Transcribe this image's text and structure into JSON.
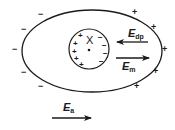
{
  "diagram": {
    "type": "electric-field-polarization",
    "outer_ellipse": {
      "cx": 92,
      "cy": 51,
      "rx": 70,
      "ry": 41
    },
    "inner_circle": {
      "cx": 89,
      "cy": 49,
      "r": 20
    },
    "colors": {
      "stroke": "#1a1a1a",
      "background": "#ffffff"
    },
    "outer_charges": {
      "negative": [
        {
          "sym": "−",
          "x": 38,
          "y": 10
        },
        {
          "sym": "−",
          "x": 21,
          "y": 25
        },
        {
          "sym": "−",
          "x": 12,
          "y": 45
        },
        {
          "sym": "−",
          "x": 21,
          "y": 68
        },
        {
          "sym": "−",
          "x": 38,
          "y": 82
        }
      ],
      "positive": [
        {
          "sym": "+",
          "x": 132,
          "y": 8
        },
        {
          "sym": "+",
          "x": 151,
          "y": 23
        },
        {
          "sym": "+",
          "x": 162,
          "y": 45
        },
        {
          "sym": "+",
          "x": 153,
          "y": 67
        },
        {
          "sym": "+",
          "x": 134,
          "y": 82
        }
      ]
    },
    "inner_charges": {
      "positive": [
        {
          "sym": "+",
          "x": 78,
          "y": 32
        },
        {
          "sym": "+",
          "x": 73,
          "y": 40
        },
        {
          "sym": "+",
          "x": 72,
          "y": 48
        },
        {
          "sym": "+",
          "x": 74,
          "y": 55
        },
        {
          "sym": "+",
          "x": 79,
          "y": 61
        }
      ],
      "negative": [
        {
          "sym": "−",
          "x": 98,
          "y": 34
        },
        {
          "sym": "−",
          "x": 102,
          "y": 42
        },
        {
          "sym": "−",
          "x": 103,
          "y": 50
        },
        {
          "sym": "−",
          "x": 99,
          "y": 58
        }
      ]
    },
    "center_mark": {
      "sym": "X",
      "x": 86,
      "y": 35
    },
    "labels": {
      "edp": {
        "main": "E",
        "sub": "dp"
      },
      "em": {
        "main": "E",
        "sub": "m"
      },
      "ea": {
        "main": "E",
        "sub": "a"
      }
    },
    "arrows": {
      "edp": {
        "x1": 148,
        "y1": 42,
        "x2": 116,
        "y2": 42,
        "direction": "left"
      },
      "em": {
        "x1": 116,
        "y1": 58,
        "x2": 150,
        "y2": 58,
        "direction": "right"
      },
      "ea": {
        "x1": 52,
        "y1": 118,
        "x2": 92,
        "y2": 118,
        "direction": "right"
      }
    }
  }
}
